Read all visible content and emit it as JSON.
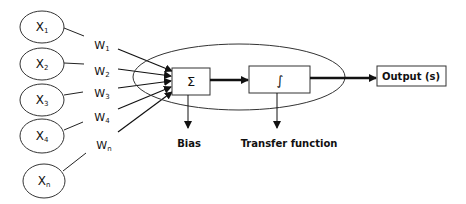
{
  "diagram": {
    "type": "neural-network-neuron",
    "inputs": [
      {
        "base": "X",
        "sub": "1"
      },
      {
        "base": "X",
        "sub": "2"
      },
      {
        "base": "X",
        "sub": "3"
      },
      {
        "base": "X",
        "sub": "4"
      },
      {
        "base": "X",
        "sub": "n"
      }
    ],
    "weights": [
      {
        "base": "W",
        "sub": "1"
      },
      {
        "base": "W",
        "sub": "2"
      },
      {
        "base": "W",
        "sub": "3"
      },
      {
        "base": "W",
        "sub": "4"
      },
      {
        "base": "W",
        "sub": "n"
      }
    ],
    "summation_symbol": "Σ",
    "transfer_symbol": "∫",
    "bias_label": "Bias",
    "transfer_label": "Transfer function",
    "output_label": "Output (s)"
  }
}
